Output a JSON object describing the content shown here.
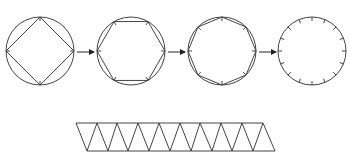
{
  "diagram": {
    "title": "",
    "stroke_color": "#444444",
    "background": "#ffffff",
    "circles": [
      {
        "id": "circle-square",
        "cx": 40,
        "cy": 51,
        "r": 34,
        "polygon_sides": 4,
        "rotation_deg": 0,
        "ticks": 4,
        "label": ""
      },
      {
        "id": "circle-hexagon",
        "cx": 131,
        "cy": 51,
        "r": 34,
        "polygon_sides": 6,
        "rotation_deg": 0,
        "ticks": 6,
        "label": ""
      },
      {
        "id": "circle-octagon",
        "cx": 222,
        "cy": 51,
        "r": 34,
        "polygon_sides": 8,
        "rotation_deg": 0,
        "ticks": 8,
        "label": ""
      },
      {
        "id": "circle-ticks",
        "cx": 312,
        "cy": 51,
        "r": 34,
        "polygon_sides": 0,
        "rotation_deg": 0,
        "ticks": 16,
        "label": ""
      }
    ],
    "arrows": [
      {
        "x1": 77,
        "y1": 52,
        "x2": 94,
        "y2": 52
      },
      {
        "x1": 168,
        "y1": 52,
        "x2": 185,
        "y2": 52
      },
      {
        "x1": 259,
        "y1": 52,
        "x2": 276,
        "y2": 52
      }
    ],
    "strip": {
      "top_y": 123,
      "bottom_y": 151,
      "top_x": [
        76,
        97,
        117,
        138,
        159,
        180,
        200,
        221,
        242,
        263
      ],
      "bottom_x": [
        87,
        108,
        128,
        149,
        170,
        191,
        212,
        232,
        253,
        275
      ],
      "triangle_count": 19
    }
  }
}
